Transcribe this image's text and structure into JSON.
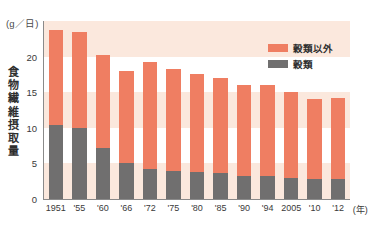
{
  "chart_data": {
    "type": "bar",
    "subtype": "stacked-vertical",
    "title": "",
    "xlabel": "年",
    "ylabel": "食物繊維摂取量",
    "yunit": "(g／日)",
    "ylim": [
      0,
      25
    ],
    "yticks": [
      0,
      5,
      10,
      15,
      20
    ],
    "ytick_labels": [
      "0",
      "5",
      "10",
      "15",
      "20"
    ],
    "grid": "horizontal-bands",
    "legend_position": "top-right",
    "categories": [
      "1951",
      "'55",
      "'60",
      "'66",
      "'72",
      "'75",
      "'80",
      "'85",
      "'90",
      "'94",
      "2005",
      "'10",
      "'12"
    ],
    "series": [
      {
        "name": "穀類以外",
        "color": "#ef7e62",
        "values": [
          13.4,
          13.5,
          13.0,
          12.9,
          15.0,
          14.3,
          13.8,
          13.4,
          12.7,
          12.8,
          12.1,
          11.2,
          11.4
        ]
      },
      {
        "name": "穀類",
        "color": "#706f6f",
        "values": [
          10.4,
          10.0,
          7.2,
          5.1,
          4.2,
          4.0,
          3.8,
          3.6,
          3.3,
          3.2,
          2.9,
          2.8,
          2.8
        ]
      }
    ],
    "totals": [
      23.8,
      23.5,
      20.2,
      18.0,
      19.2,
      18.3,
      17.6,
      17.0,
      16.0,
      16.0,
      15.0,
      14.0,
      14.2
    ]
  },
  "axis": {
    "unit_label": "(g／日)",
    "y_title_chars": [
      "食",
      "物",
      "繊",
      "維",
      "摂",
      "取",
      "量"
    ],
    "x_unit_label": "(年)"
  },
  "legend": {
    "items": [
      {
        "label": "穀類以外",
        "color": "#ef7e62"
      },
      {
        "label": "穀類",
        "color": "#706f6f"
      }
    ]
  },
  "colors": {
    "series_other": "#ef7e62",
    "series_cereal": "#706f6f",
    "band": "#fbe8dd",
    "background": "#ffffff",
    "axis": "#8a8a8a",
    "text": "#3a3a3a"
  }
}
